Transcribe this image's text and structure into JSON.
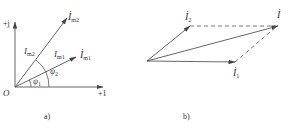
{
  "panel_a": {
    "caption": "a)",
    "axis_imag_label": "+j",
    "axis_real_label": "+1",
    "origin_label": "O",
    "phasor_m2": {
      "main": "İ",
      "sub": "m2"
    },
    "phasor_m1": {
      "main": "İ",
      "sub": "m1"
    },
    "magnitude_m2": {
      "main": "I",
      "sub": "m2"
    },
    "magnitude_m1": {
      "main": "I",
      "sub": "m1"
    },
    "angle_1": {
      "main": "ψ",
      "sub": "1"
    },
    "angle_2": {
      "main": "ψ",
      "sub": "2"
    }
  },
  "panel_b": {
    "caption": "b)",
    "phasor_1": {
      "main": "İ",
      "sub": "1"
    },
    "phasor_2": {
      "main": "İ",
      "sub": "2"
    },
    "phasor_sum": {
      "main": "İ"
    }
  },
  "colors": {
    "line": "#555555",
    "text": "#333333"
  }
}
